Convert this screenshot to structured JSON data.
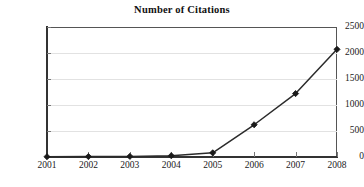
{
  "chart_data": {
    "type": "line",
    "title": "Number of Citations",
    "subtitle": "",
    "xlabel": "",
    "ylabel": "",
    "categories": [
      "2001",
      "2002",
      "2003",
      "2004",
      "2005",
      "2006",
      "2007",
      "2008"
    ],
    "x": [
      2001,
      2002,
      2003,
      2004,
      2005,
      2006,
      2007,
      2008
    ],
    "values": [
      5,
      8,
      12,
      25,
      80,
      620,
      1220,
      2070
    ],
    "series": [
      {
        "name": "Number of Citations",
        "values": [
          5,
          8,
          12,
          25,
          80,
          620,
          1220,
          2070
        ]
      }
    ],
    "ylim": [
      0,
      2500
    ],
    "ytick_labels": [
      "2500",
      "2000",
      "1500",
      "1000",
      "500",
      "0"
    ],
    "yticks": [
      2500,
      2000,
      1500,
      1000,
      500,
      0
    ],
    "grid": true,
    "grid_axis": "y",
    "legend": false,
    "legend_position": "none",
    "marker": "diamond",
    "line_color": "#2b2b2b",
    "marker_color": "#1a1a1a",
    "grid_color": "#e2e2e2",
    "axis_color": "#333333",
    "background_color": "#ffffff",
    "annotations": []
  }
}
